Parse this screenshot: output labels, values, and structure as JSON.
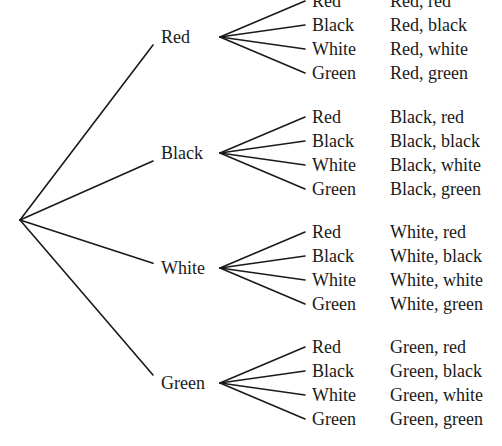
{
  "tree": {
    "root": {
      "x": 20,
      "y": 220
    },
    "level1": [
      {
        "label": "Red",
        "y": 37
      },
      {
        "label": "Black",
        "y": 153
      },
      {
        "label": "White",
        "y": 268
      },
      {
        "label": "Green",
        "y": 383
      }
    ],
    "level2_labels": [
      "Red",
      "Black",
      "White",
      "Green"
    ],
    "outcomes": [
      [
        "Red, red",
        "Red, black",
        "Red, white",
        "Red, green"
      ],
      [
        "Black, red",
        "Black, black",
        "Black, white",
        "Black, green"
      ],
      [
        "White, red",
        "White, black",
        "White, white",
        "White, green"
      ],
      [
        "Green, red",
        "Green, black",
        "Green, white",
        "Green, green"
      ]
    ],
    "layout": {
      "level1_line_end_x": 153,
      "level1_label_x": 161,
      "fan_vertex_x": 220,
      "leaf_line_end_x": 305,
      "leaf_label_x": 312,
      "outcome_x": 390,
      "leaf_offsets": [
        -36,
        -12,
        12,
        36
      ]
    }
  }
}
